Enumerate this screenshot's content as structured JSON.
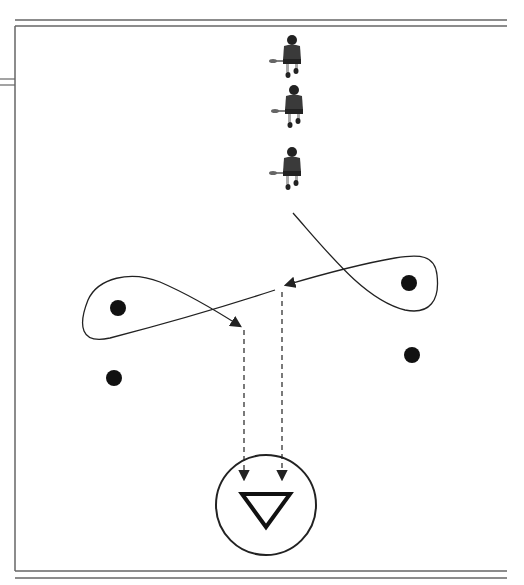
{
  "diagram": {
    "field": {
      "border_color": "#555555",
      "left_x": 15,
      "top_y": 26,
      "bottom_y": 571,
      "right_x": 507
    },
    "players": [
      {
        "id": "player-1",
        "x": 292,
        "y": 60
      },
      {
        "id": "player-2",
        "x": 294,
        "y": 110
      },
      {
        "id": "player-3",
        "x": 292,
        "y": 172
      }
    ],
    "cones": [
      {
        "id": "cone-left-top",
        "x": 118,
        "y": 308
      },
      {
        "id": "cone-left-bottom",
        "x": 114,
        "y": 378
      },
      {
        "id": "cone-right-top",
        "x": 409,
        "y": 283
      },
      {
        "id": "cone-right-bottom",
        "x": 412,
        "y": 355
      }
    ],
    "goal": {
      "cx": 266,
      "cy": 505,
      "r": 50,
      "label": "goal-crease"
    },
    "colors": {
      "line": "#222222",
      "dot": "#111111",
      "player": "#333333",
      "background": "#ffffff"
    }
  }
}
